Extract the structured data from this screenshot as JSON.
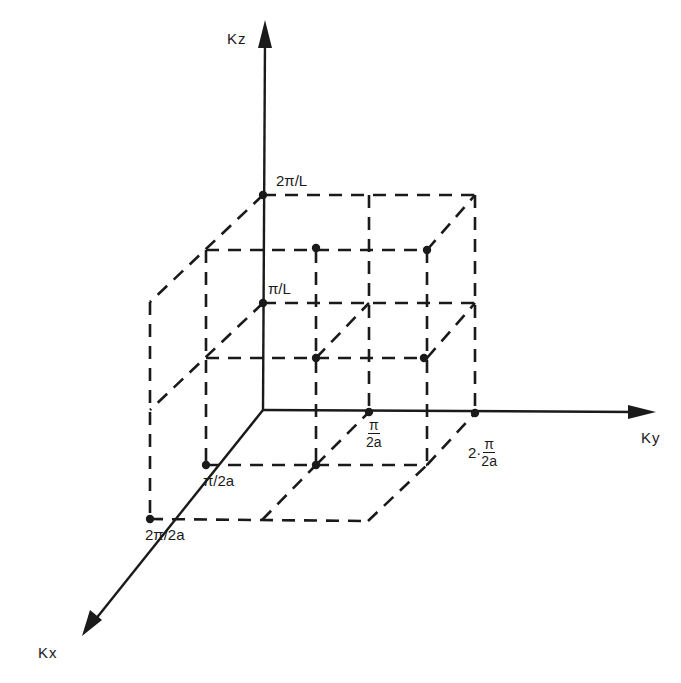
{
  "chart_data": {
    "type": "diagram",
    "title": "",
    "axes": {
      "kx": {
        "label": "Kx",
        "from": [
          263,
          410
        ],
        "to": [
          82,
          635
        ]
      },
      "ky": {
        "label": "Ky",
        "from": [
          263,
          410
        ],
        "to": [
          654,
          412
        ]
      },
      "kz": {
        "label": "Kz",
        "from": [
          263,
          410
        ],
        "to": [
          265,
          22
        ]
      }
    },
    "tick_labels": {
      "kz_1": "π/L",
      "kz_2": "2π/L",
      "kx_1": "π/2a",
      "kx_2": "2π/2a",
      "ky_1_num": "π",
      "ky_1_den": "2a",
      "ky_2_prefix": "2·",
      "ky_2_num": "π",
      "ky_2_den": "2a"
    },
    "dashed_segments": [
      [
        [
          263,
          195
        ],
        [
          475,
          195
        ]
      ],
      [
        [
          369,
          195
        ],
        [
          369,
          412
        ]
      ],
      [
        [
          475,
          195
        ],
        [
          475,
          413
        ]
      ],
      [
        [
          263,
          303
        ],
        [
          475,
          303
        ]
      ],
      [
        [
          263,
          195
        ],
        [
          150,
          302
        ]
      ],
      [
        [
          150,
          302
        ],
        [
          150,
          519
        ]
      ],
      [
        [
          263,
          303
        ],
        [
          150,
          410
        ]
      ],
      [
        [
          206,
          250
        ],
        [
          206,
          465
        ]
      ],
      [
        [
          206,
          250
        ],
        [
          427,
          250
        ]
      ],
      [
        [
          316,
          250
        ],
        [
          316,
          465
        ]
      ],
      [
        [
          427,
          250
        ],
        [
          427,
          465
        ]
      ],
      [
        [
          427,
          250
        ],
        [
          475,
          195
        ]
      ],
      [
        [
          206,
          358
        ],
        [
          427,
          358
        ]
      ],
      [
        [
          316,
          358
        ],
        [
          369,
          303
        ]
      ],
      [
        [
          427,
          358
        ],
        [
          475,
          303
        ]
      ],
      [
        [
          206,
          465
        ],
        [
          427,
          465
        ]
      ],
      [
        [
          316,
          465
        ],
        [
          369,
          412
        ]
      ],
      [
        [
          427,
          465
        ],
        [
          475,
          413
        ]
      ],
      [
        [
          150,
          519
        ],
        [
          368,
          521
        ]
      ],
      [
        [
          262,
          520
        ],
        [
          316,
          465
        ]
      ],
      [
        [
          368,
          521
        ],
        [
          427,
          465
        ]
      ]
    ],
    "points": [
      [
        263,
        195
      ],
      [
        263,
        303
      ],
      [
        316,
        248
      ],
      [
        427,
        250
      ],
      [
        316,
        358
      ],
      [
        424,
        358
      ],
      [
        369,
        412
      ],
      [
        475,
        413
      ],
      [
        206,
        465
      ],
      [
        316,
        465
      ],
      [
        150,
        519
      ]
    ]
  }
}
